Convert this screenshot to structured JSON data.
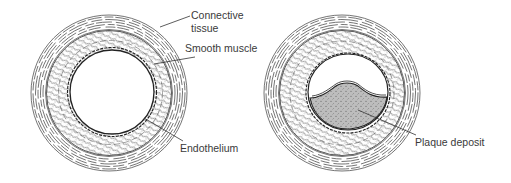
{
  "figure": {
    "panels": [
      {
        "id": "healthy-artery",
        "description": "Cross-section of normal artery",
        "labels": {
          "connective_line1": "Connective",
          "connective_line2": "tissue",
          "smooth_muscle": "Smooth muscle",
          "endothelium": "Endothelium"
        }
      },
      {
        "id": "occluded-artery",
        "description": "Cross-section of artery with plaque",
        "labels": {
          "plaque": "Plaque deposit"
        }
      }
    ],
    "colors": {
      "line": "#2a2a2a",
      "plaque_fill": "#b8b8b8",
      "background": "#ffffff"
    }
  }
}
